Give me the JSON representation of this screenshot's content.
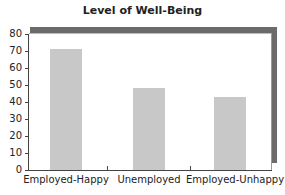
{
  "chart_data": {
    "type": "bar",
    "title": "Level of Well-Being",
    "categories": [
      "Employed-Happy",
      "Unemployed",
      "Employed-Unhappy"
    ],
    "values": [
      71,
      48,
      43
    ],
    "xlabel": "",
    "ylabel": "",
    "ylim": [
      0,
      80
    ],
    "yticks": [
      "0",
      "10",
      "20",
      "30",
      "40",
      "50",
      "60",
      "70",
      "80"
    ],
    "grid": false,
    "legend": null,
    "colors": {
      "bar": "#c8c8c8",
      "frame": "#6b6b6b"
    }
  }
}
